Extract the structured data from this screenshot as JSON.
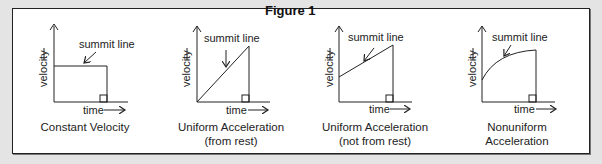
{
  "figure": {
    "title": "Figure 1"
  },
  "axes": {
    "y_label": "velocity",
    "x_label": "time"
  },
  "panels": [
    {
      "annotation": "summit line",
      "caption_line1": "Constant Velocity",
      "caption_line2": ""
    },
    {
      "annotation": "summit line",
      "caption_line1": "Uniform Acceleration",
      "caption_line2": "(from rest)"
    },
    {
      "annotation": "summit line",
      "caption_line1": "Uniform Acceleration",
      "caption_line2": "(not from rest)"
    },
    {
      "annotation": "summit line",
      "caption_line1": "Nonuniform",
      "caption_line2": "Acceleration"
    }
  ],
  "colors": {
    "background": "#e4e4e4",
    "panel": "#ffffff",
    "ink": "#222222"
  }
}
